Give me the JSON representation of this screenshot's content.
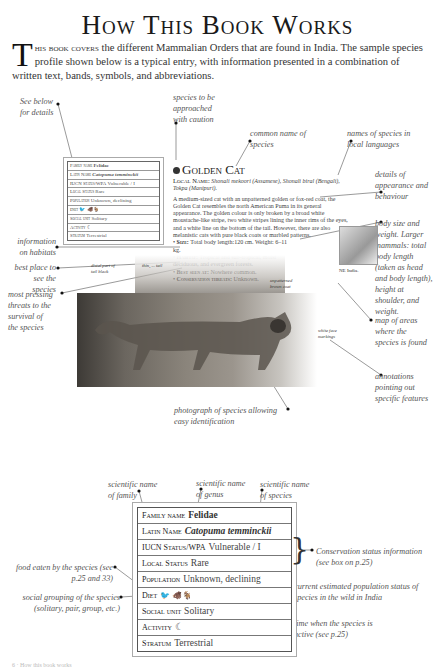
{
  "page": {
    "title": "How This Book Works",
    "intro": {
      "dropcap": "T",
      "lead_caps": "his book covers",
      "text_line1": " the different Mammalian Orders that are found in India.",
      "text_rest": "The sample species profile shown below is a typical entry, with information presented in a combination of written text, bands, symbols, and abbreviations."
    }
  },
  "annotations_top": {
    "see_below": "See below for details",
    "caution": "species to be approached with caution",
    "common_name": "common name of species",
    "local_names": "names of species in local languages",
    "appearance": "details of appearance and behaviour",
    "body_size": "body size and weight. Larger mammals: total body length (taken as head and body length), height at shoulder, and weight.",
    "habitats": "information on habitats",
    "best_place": "best place to see the species",
    "threats": "most pressing threats to the survival of the species",
    "map": "map of areas where the species is found",
    "annotations": "annotations pointing out specific features",
    "photograph": "photograph of species allowing easy identification"
  },
  "small_factbox": {
    "rows": [
      {
        "key": "Family name",
        "value": "Felidae"
      },
      {
        "key": "Latin Name",
        "value": "Catopuma temminckii"
      },
      {
        "key": "IUCN Status/WPA",
        "value": "Vulnerable / I"
      },
      {
        "key": "Local Status",
        "value": "Rare"
      },
      {
        "key": "Population",
        "value": "Unknown, declining"
      },
      {
        "key": "Diet",
        "value": "🐦 🐗🐐"
      },
      {
        "key": "Social unit",
        "value": "Solitary"
      },
      {
        "key": "Activity",
        "value": "☾"
      },
      {
        "key": "Stratum",
        "value": "Terrestrial"
      }
    ]
  },
  "profile": {
    "name": "Golden Cat",
    "local_name_label": "Local Name:",
    "local_name_text": "Shonali mekoori (Assamese), Shonali biral (Bengali), Tokpa (Manipuri).",
    "description": "A medium-sized cat with an unpatterned golden or fox-red coat, the Golden Cat resembles the north American Puma in its general appearance. The golden colour is only broken by a broad white moustache-like stripe, two white stripes lining the inner rims of the eyes, and a white line on the bottom of the tail. However, there are also melanistic cats with pure black coats or marbled patterns.",
    "facts": [
      {
        "label": "Size:",
        "text": "Total body length:120 cm. Weight: 6–11 kg."
      },
      {
        "label": "Habitat:",
        "text": "Tropical and sub-tropical, moist deciduous, and evergreen forests."
      },
      {
        "label": "Best seen at:",
        "text": "Nowhere common."
      },
      {
        "label": "Conservation threats:",
        "text": "Unknown."
      }
    ],
    "map_label": "NE India.",
    "photo_notes": {
      "tail": "distal part of tail black",
      "thin_tail": "thin, ... tail",
      "coat": "unpatterned brown coat",
      "face": "white face markings"
    }
  },
  "annotations_bottom": {
    "family": "scientific name of family",
    "genus": "scientific name of genus",
    "species": "scientific name of species",
    "conservation": "Conservation status information (see box on p.25)",
    "food": "food eaten by the species (see p.25 and 33)",
    "population": "current estimated population status of species in the wild in India",
    "social": "social grouping of the species (solitary, pair, group, etc.)",
    "activity": "time when the species is active (see p.25)",
    "stratum": "use of stratum by the species (see p.18)"
  },
  "big_factbox": {
    "rows": [
      {
        "key": "Family name",
        "value": "Felidae"
      },
      {
        "key": "Latin Name",
        "value": "Catopuma temminckii"
      },
      {
        "key": "IUCN Status/WPA",
        "value": "Vulnerable / I"
      },
      {
        "key": "Local Status",
        "value": "Rare"
      },
      {
        "key": "Population",
        "value": "Unknown, declining"
      },
      {
        "key": "Diet",
        "value": "🐦 🐗🐐"
      },
      {
        "key": "Social unit",
        "value": "Solitary"
      },
      {
        "key": "Activity",
        "value": "☾"
      },
      {
        "key": "Stratum",
        "value": "Terrestrial"
      }
    ]
  },
  "footer": {
    "text": "6  ·  How this book works"
  }
}
